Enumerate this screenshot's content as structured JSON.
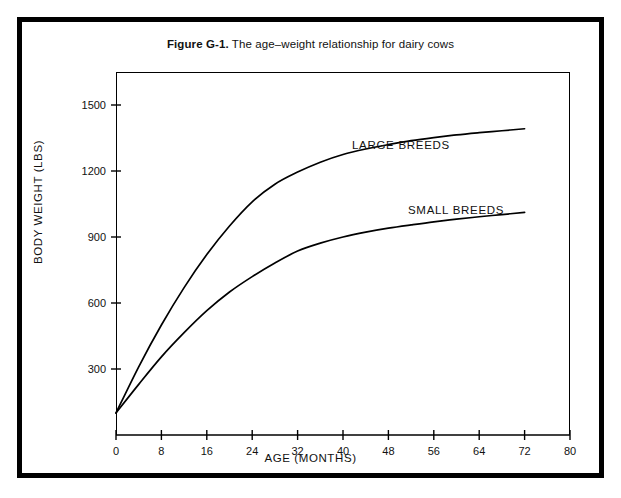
{
  "figure": {
    "caption_label": "Figure G-1.",
    "caption_text": "The age–weight relationship for dairy cows",
    "border_color": "#000000",
    "background_color": "#ffffff"
  },
  "chart_data": {
    "type": "line",
    "title": "Figure G-1.  The age–weight relationship for dairy cows",
    "xlabel": "AGE (MONTHS)",
    "ylabel": "BODY WEIGHT (LBS)",
    "xlim": [
      0,
      80
    ],
    "ylim": [
      0,
      1650
    ],
    "xticks": [
      0,
      8,
      16,
      24,
      32,
      40,
      48,
      56,
      64,
      72,
      80
    ],
    "yticks": [
      300,
      600,
      900,
      1200,
      1500
    ],
    "grid": false,
    "legend": "inline-annotations",
    "x": [
      0,
      4,
      8,
      12,
      16,
      20,
      24,
      28,
      32,
      36,
      40,
      44,
      48,
      52,
      56,
      60,
      64,
      68,
      72
    ],
    "series": [
      {
        "name": "LARGE BREEDS",
        "color": "#000000",
        "values": [
          100,
          310,
          500,
          670,
          820,
          950,
          1060,
          1140,
          1195,
          1240,
          1275,
          1300,
          1320,
          1338,
          1352,
          1364,
          1374,
          1383,
          1392
        ]
      },
      {
        "name": "SMALL BREEDS",
        "color": "#000000",
        "values": [
          100,
          230,
          355,
          465,
          565,
          650,
          720,
          782,
          836,
          872,
          900,
          922,
          940,
          955,
          969,
          981,
          992,
          1002,
          1012
        ]
      }
    ],
    "annotations": [
      {
        "text": "LARGE BREEDS",
        "x": 42,
        "y": 1430
      },
      {
        "text": "SMALL BREEDS",
        "x": 52,
        "y": 1105
      }
    ]
  },
  "axes": {
    "x_tick_labels": [
      "0",
      "8",
      "16",
      "24",
      "32",
      "40",
      "48",
      "56",
      "64",
      "72",
      "80"
    ],
    "y_tick_labels": [
      "300",
      "600",
      "900",
      "1200",
      "1500"
    ],
    "x_title": "AGE (MONTHS)",
    "y_title": "BODY WEIGHT (LBS)"
  }
}
